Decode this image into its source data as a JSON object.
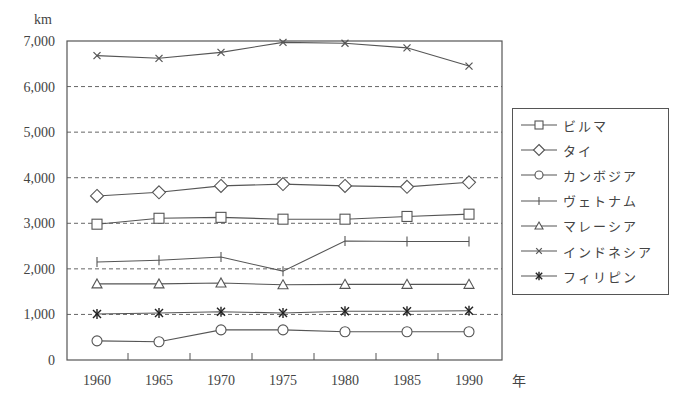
{
  "chart_data": {
    "type": "line",
    "title": "",
    "xlabel": "年",
    "ylabel": "km",
    "x": [
      1960,
      1965,
      1970,
      1975,
      1980,
      1985,
      1990
    ],
    "ylim": [
      0,
      7000
    ],
    "yticks": [
      "0",
      "1,000",
      "2,000",
      "3,000",
      "4,000",
      "5,000",
      "6,000",
      "7,000"
    ],
    "grid": "horizontal dashed",
    "legend_position": "right",
    "series": [
      {
        "name": "ビルマ",
        "marker": "square",
        "values": [
          2980,
          3110,
          3130,
          3090,
          3090,
          3150,
          3200
        ]
      },
      {
        "name": "タイ",
        "marker": "diamond",
        "values": [
          3600,
          3680,
          3820,
          3860,
          3820,
          3800,
          3900
        ]
      },
      {
        "name": "カンボジア",
        "marker": "circle",
        "values": [
          420,
          400,
          660,
          660,
          620,
          620,
          620
        ]
      },
      {
        "name": "ヴェトナム",
        "marker": "plus",
        "values": [
          2150,
          2190,
          2260,
          1950,
          2610,
          2600,
          2600
        ]
      },
      {
        "name": "マレーシア",
        "marker": "triangle",
        "values": [
          1670,
          1670,
          1690,
          1650,
          1660,
          1660,
          1660
        ]
      },
      {
        "name": "インドネシア",
        "marker": "x",
        "values": [
          6680,
          6620,
          6750,
          6970,
          6950,
          6850,
          6450
        ]
      },
      {
        "name": "フィリピン",
        "marker": "asterisk",
        "values": [
          1010,
          1030,
          1060,
          1030,
          1070,
          1070,
          1080
        ]
      }
    ]
  },
  "axis": {
    "unit_label": "km",
    "x_unit_label": "年"
  }
}
